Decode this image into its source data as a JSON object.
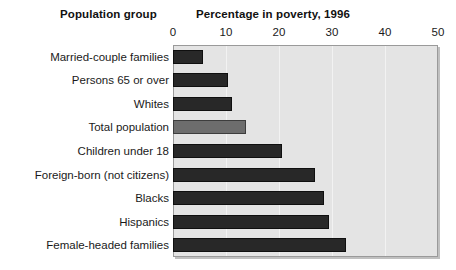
{
  "header": {
    "group_title": "Population group",
    "value_title": "Percentage in poverty, 1996"
  },
  "chart_data": {
    "type": "bar",
    "orientation": "horizontal",
    "title": "Percentage in poverty, 1996",
    "xlabel": "Percentage in poverty, 1996",
    "ylabel": "Population group",
    "xlim": [
      0,
      50
    ],
    "xticks": [
      0,
      10,
      20,
      30,
      40,
      50
    ],
    "xtick_labels": [
      "0",
      "10",
      "20",
      "30",
      "40",
      "50"
    ],
    "grid": true,
    "legend": "none",
    "categories": [
      "Married-couple families",
      "Persons 65 or over",
      "Whites",
      "Total population",
      "Children under 18",
      "Foreign-born (not citizens)",
      "Blacks",
      "Hispanics",
      "Female-headed families"
    ],
    "values": [
      5.6,
      10.4,
      11.2,
      13.7,
      20.5,
      26.8,
      28.4,
      29.4,
      32.6
    ],
    "highlight_category": "Total population",
    "colors": {
      "bar": "#282828",
      "bar_highlight": "#6d6d6d",
      "plot_background": "#e4e4e4",
      "plot_border": "#9a9a9a",
      "gridline": "#f2f2f2",
      "text": "#1a1a1a"
    }
  }
}
